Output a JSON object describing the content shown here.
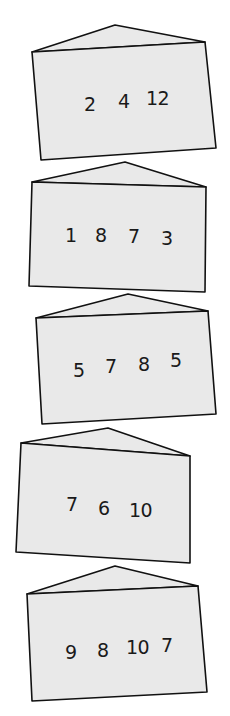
{
  "fill_color": "#e9e9e9",
  "stroke_color": "#111111",
  "envelopes": [
    {
      "numbers": [
        "2",
        "4",
        "12"
      ],
      "flap_peak": [
        115,
        25
      ],
      "body": [
        [
          32,
          52
        ],
        [
          205,
          42
        ],
        [
          216,
          148
        ],
        [
          41,
          160
        ]
      ],
      "number_positions": [
        [
          84,
          95
        ],
        [
          118,
          92
        ],
        [
          146,
          89
        ]
      ]
    },
    {
      "numbers": [
        "1",
        "8",
        "7",
        "3"
      ],
      "flap_peak": [
        125,
        162
      ],
      "body": [
        [
          32,
          182
        ],
        [
          206,
          187
        ],
        [
          205,
          292
        ],
        [
          29,
          286
        ]
      ],
      "number_positions": [
        [
          65,
          226
        ],
        [
          95,
          226
        ],
        [
          128,
          227
        ],
        [
          161,
          229
        ]
      ]
    },
    {
      "numbers": [
        "5",
        "7",
        "8",
        "5"
      ],
      "flap_peak": [
        128,
        294
      ],
      "body": [
        [
          36,
          318
        ],
        [
          208,
          311
        ],
        [
          216,
          414
        ],
        [
          42,
          424
        ]
      ],
      "number_positions": [
        [
          73,
          361
        ],
        [
          105,
          357
        ],
        [
          138,
          355
        ],
        [
          170,
          351
        ]
      ]
    },
    {
      "numbers": [
        "7",
        "6",
        "10"
      ],
      "flap_peak": [
        108,
        428
      ],
      "body": [
        [
          21,
          443
        ],
        [
          190,
          456
        ],
        [
          190,
          563
        ],
        [
          16,
          552
        ]
      ],
      "number_positions": [
        [
          66,
          495
        ],
        [
          98,
          499
        ],
        [
          129,
          501
        ]
      ]
    },
    {
      "numbers": [
        "9",
        "8",
        "10",
        "7"
      ],
      "flap_peak": [
        115,
        566
      ],
      "body": [
        [
          27,
          594
        ],
        [
          198,
          586
        ],
        [
          207,
          692
        ],
        [
          32,
          701
        ]
      ],
      "number_positions": [
        [
          65,
          643
        ],
        [
          97,
          641
        ],
        [
          126,
          638
        ],
        [
          161,
          636
        ]
      ]
    }
  ]
}
